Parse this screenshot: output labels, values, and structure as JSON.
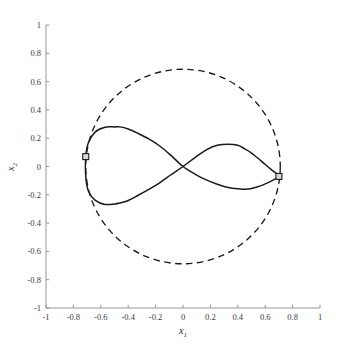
{
  "figure": {
    "background": "#ffffff",
    "axis_color": "#8c8c8c",
    "curve_color": "#1a1a1a",
    "marker_face": "#d9d9d9",
    "width": 337,
    "height": 344
  },
  "axes": {
    "x_label_main": "x",
    "x_label_sub": "1",
    "y_label_main": "x",
    "y_label_sub": "2",
    "x_ticks": [
      "-1",
      "-0.8",
      "-0.6",
      "-0.4",
      "-0.2",
      "0",
      "0.2",
      "0.4",
      "0.6",
      "0.8",
      "1"
    ],
    "y_ticks": [
      "1",
      "0.8",
      "0.6",
      "0.4",
      "0.2",
      "0",
      "-0.2",
      "-0.4",
      "-0.6",
      "-0.8",
      "-1"
    ],
    "x_tick_values": [
      -1,
      -0.8,
      -0.6,
      -0.4,
      -0.2,
      0,
      0.2,
      0.4,
      0.6,
      0.8,
      1
    ],
    "y_tick_values": [
      1,
      0.8,
      0.6,
      0.4,
      0.2,
      0,
      -0.2,
      -0.4,
      -0.6,
      -0.8,
      -1
    ]
  },
  "chart_data": {
    "type": "line",
    "title": "",
    "xlabel": "x_1",
    "ylabel": "x_2",
    "xlim": [
      -1,
      1
    ],
    "ylim": [
      -1,
      1
    ],
    "grid": false,
    "legend": "none",
    "series": [
      {
        "name": "constraint-circle",
        "style": "dashed",
        "color": "#1a1a1a",
        "shape": "circle",
        "center": [
          0,
          0
        ],
        "radius": 0.71,
        "description": "Dashed circle of radius 0.71 centred at the origin"
      },
      {
        "name": "figure-eight-trajectory",
        "style": "solid",
        "color": "#1a1a1a",
        "shape": "lemniscate",
        "description": "Closed figure-eight (lemniscate) crossing itself at the origin",
        "x": [
          -0.71,
          -0.69,
          -0.64,
          -0.57,
          -0.5,
          -0.46,
          -0.4,
          -0.33,
          -0.25,
          -0.17,
          -0.09,
          0.0,
          0.09,
          0.17,
          0.25,
          0.33,
          0.4,
          0.45,
          0.5,
          0.57,
          0.64,
          0.69,
          0.71,
          0.69,
          0.64,
          0.57,
          0.5,
          0.45,
          0.4,
          0.33,
          0.25,
          0.17,
          0.09,
          0.0,
          -0.09,
          -0.17,
          -0.25,
          -0.33,
          -0.4,
          -0.46,
          -0.5,
          -0.57,
          -0.64,
          -0.69,
          -0.71
        ],
        "y": [
          0.07,
          0.17,
          0.245,
          0.278,
          0.28,
          0.28,
          0.265,
          0.235,
          0.195,
          0.145,
          0.08,
          0.0,
          -0.055,
          -0.095,
          -0.125,
          -0.148,
          -0.158,
          -0.16,
          -0.155,
          -0.135,
          -0.105,
          -0.08,
          -0.07,
          -0.055,
          -0.018,
          0.04,
          0.095,
          0.125,
          0.15,
          0.158,
          0.15,
          0.118,
          0.065,
          0.0,
          -0.06,
          -0.115,
          -0.162,
          -0.205,
          -0.24,
          -0.258,
          -0.265,
          -0.268,
          -0.24,
          -0.175,
          -0.07
        ]
      }
    ],
    "markers": [
      {
        "name": "start-point-left",
        "x": -0.71,
        "y": 0.07,
        "symbol": "square"
      },
      {
        "name": "end-point-right",
        "x": 0.7,
        "y": -0.07,
        "symbol": "square"
      }
    ],
    "annotations": []
  }
}
